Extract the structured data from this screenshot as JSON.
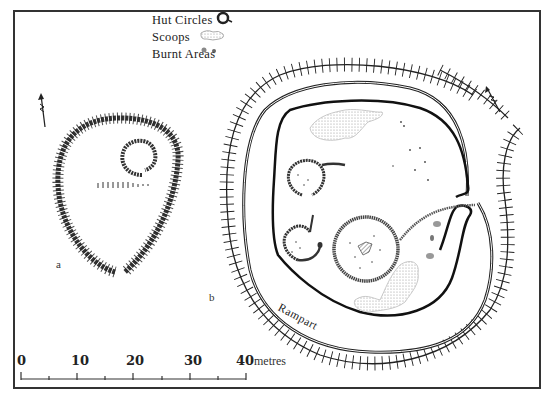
{
  "legend": {
    "items": [
      {
        "label": "Hut Circles",
        "symbol": "hut-circle"
      },
      {
        "label": "Scoops",
        "symbol": "scoop"
      },
      {
        "label": "Burnt Areas",
        "symbol": "burnt-area"
      }
    ]
  },
  "plans": {
    "a": {
      "label": "a"
    },
    "b": {
      "label": "b",
      "rampart_label": "Rampart"
    }
  },
  "scale_bar": {
    "ticks": [
      "0",
      "10",
      "20",
      "30",
      "40"
    ],
    "unit": "metres"
  },
  "colors": {
    "ink": "#222222",
    "frame": "#333333",
    "scoop_stipple": "#bbbbbb",
    "burnt": "#888888"
  }
}
